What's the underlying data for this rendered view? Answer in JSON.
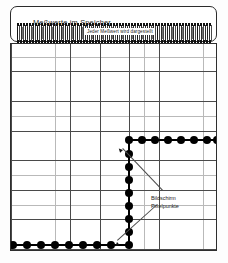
{
  "figure": {
    "title": "Meßwerte im Speicher",
    "inner_label": "Jeder Meßwert wird dargestellt",
    "annotation_line1": "Bildschirm",
    "annotation_line2": "Pixelpunkte",
    "colors": {
      "ink": "#000000",
      "grid_minor": "#b9b9b9",
      "grid_major": "#4a4a4a",
      "frame": "#2e2e2e",
      "paper": "#ffffff"
    }
  },
  "chart_data": {
    "type": "scatter",
    "title": "Meßwerte im Speicher",
    "subtitle": "Jeder Meßwert wird dargestellt",
    "xlabel": "",
    "ylabel": "",
    "grid": true,
    "legend": "none",
    "annotations": [
      {
        "text": "Bildschirm Pixelpunkte",
        "points_to": [
          "upper step corner",
          "lower step corner"
        ]
      }
    ],
    "segments": [
      {
        "name": "lower-run",
        "orientation": "horizontal",
        "y": 201,
        "x_start": 2,
        "x_end": 118,
        "dot_count": 9
      },
      {
        "name": "vertical-rise",
        "orientation": "vertical",
        "x": 118,
        "y_start": 201,
        "y_end": 96,
        "dot_count": 8
      },
      {
        "name": "upper-run",
        "orientation": "horizontal",
        "y": 96,
        "x_start": 118,
        "x_end": 206,
        "dot_count": 8
      }
    ],
    "points": [
      {
        "x": 2,
        "y": 201
      },
      {
        "x": 16,
        "y": 201
      },
      {
        "x": 30,
        "y": 201
      },
      {
        "x": 44,
        "y": 201
      },
      {
        "x": 58,
        "y": 201
      },
      {
        "x": 72,
        "y": 201
      },
      {
        "x": 86,
        "y": 201
      },
      {
        "x": 100,
        "y": 201
      },
      {
        "x": 118,
        "y": 201
      },
      {
        "x": 118,
        "y": 188
      },
      {
        "x": 118,
        "y": 175
      },
      {
        "x": 118,
        "y": 162
      },
      {
        "x": 118,
        "y": 149
      },
      {
        "x": 118,
        "y": 136
      },
      {
        "x": 118,
        "y": 123
      },
      {
        "x": 118,
        "y": 110
      },
      {
        "x": 118,
        "y": 96
      },
      {
        "x": 131,
        "y": 96
      },
      {
        "x": 144,
        "y": 96
      },
      {
        "x": 157,
        "y": 96
      },
      {
        "x": 170,
        "y": 96
      },
      {
        "x": 183,
        "y": 96
      },
      {
        "x": 196,
        "y": 96
      },
      {
        "x": 206,
        "y": 96
      }
    ],
    "grid_spacing_minor": 15,
    "grid_spacing_major": 30
  }
}
